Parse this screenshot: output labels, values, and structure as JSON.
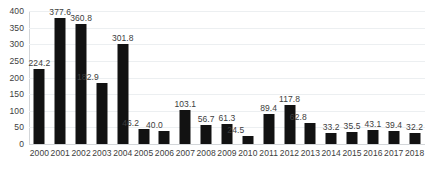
{
  "chart_data": {
    "type": "bar",
    "title": "",
    "subtitle": "",
    "xlabel": "",
    "ylabel": "",
    "categories": [
      "2000",
      "2001",
      "2002",
      "2003",
      "2004",
      "2005",
      "2006",
      "2007",
      "2008",
      "2009",
      "2010",
      "2011",
      "2012",
      "2013",
      "2014",
      "2015",
      "2016",
      "2017",
      "2018"
    ],
    "values": [
      224.2,
      377.6,
      360.8,
      182.9,
      301.8,
      46.2,
      40.0,
      103.1,
      56.7,
      61.3,
      24.5,
      89.4,
      117.8,
      62.8,
      33.2,
      35.5,
      43.1,
      39.4,
      32.2
    ],
    "value_labels": [
      "224.2",
      "377.6",
      "360.8",
      "182.9",
      "301.8",
      "46.2",
      "40.0",
      "103.1",
      "56.7",
      "61.3",
      "24.5",
      "89.4",
      "117.8",
      "62.8",
      "33.2",
      "35.5",
      "43.1",
      "39.4",
      "32.2"
    ],
    "label_offsets_px": [
      0,
      0,
      0,
      -14,
      0,
      -13,
      -10,
      0,
      0,
      0,
      -12,
      0,
      0,
      -12,
      0,
      0,
      0,
      0,
      0
    ],
    "ylim": [
      0,
      400
    ],
    "yticks": [
      0,
      50,
      100,
      150,
      200,
      250,
      300,
      350,
      400
    ],
    "ytick_labels": [
      "0",
      "50",
      "100",
      "150",
      "200",
      "250",
      "300",
      "350",
      "400"
    ],
    "grid": true,
    "grid_axis": "y",
    "legend": false,
    "legend_position": "none",
    "bar_color": "#121212",
    "grid_color": "#eceff1",
    "axis_color": "#d3d6d9",
    "text_color": "#3d3d3d",
    "background_color": "#ffffff",
    "data_labels_shown": true
  }
}
